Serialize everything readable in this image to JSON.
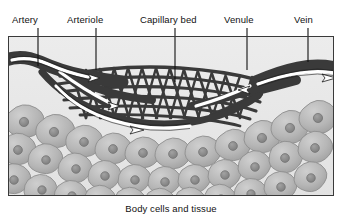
{
  "figure": {
    "caption": "Body cells and tissue",
    "frame": {
      "x": 8,
      "y": 36,
      "width": 326,
      "height": 160,
      "border_color": "#333333",
      "background": "#e8e8e8"
    }
  },
  "labels": [
    {
      "id": "artery",
      "text": "Artery",
      "x": 12,
      "y": 14,
      "leader_x": 38,
      "leader_y1": 28,
      "leader_y2": 66
    },
    {
      "id": "arteriole",
      "text": "Arteriole",
      "x": 67,
      "y": 14,
      "leader_x": 96,
      "leader_y1": 28,
      "leader_y2": 70
    },
    {
      "id": "capillary-bed",
      "text": "Capillary bed",
      "x": 140,
      "y": 14,
      "leader_x": 175,
      "leader_y1": 28,
      "leader_y2": 82
    },
    {
      "id": "venule",
      "text": "Venule",
      "x": 224,
      "y": 14,
      "leader_x": 247,
      "leader_y1": 28,
      "leader_y2": 70
    },
    {
      "id": "vein",
      "text": "Vein",
      "x": 294,
      "y": 14,
      "leader_x": 308,
      "leader_y1": 28,
      "leader_y2": 62
    }
  ],
  "colors": {
    "vessel_dark": "#3a3a3a",
    "vessel_outline": "#242424",
    "lumen_white": "#fdfdfd",
    "cell_fill": "#b3b3b3",
    "cell_nucleus": "#8a8a8a",
    "cell_stroke": "#8f8f8f",
    "background": "#e9e9e9",
    "frame_border": "#3a3a3a",
    "text": "#111111",
    "arrow_white": "#ffffff",
    "arrow_outline": "#1a1a1a"
  },
  "flow": {
    "direction_in_label": "blood enters via artery and arteriole",
    "direction_out_label": "blood exits via venule and vein",
    "arrow_count": 5
  },
  "structures": [
    {
      "name": "artery",
      "side": "left",
      "role": "inflow vessel"
    },
    {
      "name": "arteriole",
      "side": "left",
      "role": "branching inflow"
    },
    {
      "name": "capillary-bed",
      "side": "center",
      "role": "exchange mesh network"
    },
    {
      "name": "venule",
      "side": "right",
      "role": "collecting outflow"
    },
    {
      "name": "vein",
      "side": "right",
      "role": "outflow vessel"
    },
    {
      "name": "body-cells",
      "side": "below",
      "role": "surrounding tissue"
    }
  ]
}
